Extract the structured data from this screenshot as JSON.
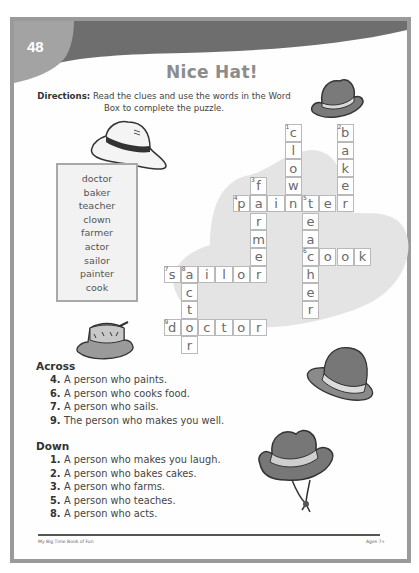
{
  "page": {
    "number": "48",
    "title": "Nice Hat!",
    "directions_label": "Directions:",
    "directions_text": " Read the clues and use the words in the Word Box to complete the puzzle."
  },
  "word_box": {
    "words": [
      "doctor",
      "baker",
      "teacher",
      "clown",
      "farmer",
      "actor",
      "sailor",
      "painter",
      "cook"
    ]
  },
  "puzzle": {
    "cells": [
      {
        "col": 7,
        "row": 0,
        "letter": "c",
        "num": "1"
      },
      {
        "col": 7,
        "row": 1,
        "letter": "l"
      },
      {
        "col": 7,
        "row": 2,
        "letter": "o"
      },
      {
        "col": 7,
        "row": 3,
        "letter": "w"
      },
      {
        "col": 10,
        "row": 0,
        "letter": "b",
        "num": "2"
      },
      {
        "col": 10,
        "row": 1,
        "letter": "a"
      },
      {
        "col": 10,
        "row": 2,
        "letter": "k"
      },
      {
        "col": 10,
        "row": 3,
        "letter": "e"
      },
      {
        "col": 5,
        "row": 3,
        "letter": "f",
        "num": "3"
      },
      {
        "col": 4,
        "row": 4,
        "letter": "p",
        "num": "4"
      },
      {
        "col": 5,
        "row": 4,
        "letter": "a"
      },
      {
        "col": 6,
        "row": 4,
        "letter": "i"
      },
      {
        "col": 7,
        "row": 4,
        "letter": "n"
      },
      {
        "col": 8,
        "row": 4,
        "letter": "t",
        "num": "5"
      },
      {
        "col": 9,
        "row": 4,
        "letter": "e"
      },
      {
        "col": 10,
        "row": 4,
        "letter": "r"
      },
      {
        "col": 5,
        "row": 5,
        "letter": "r"
      },
      {
        "col": 5,
        "row": 6,
        "letter": "m"
      },
      {
        "col": 5,
        "row": 7,
        "letter": "e"
      },
      {
        "col": 8,
        "row": 5,
        "letter": "e"
      },
      {
        "col": 8,
        "row": 6,
        "letter": "a"
      },
      {
        "col": 8,
        "row": 7,
        "letter": "c",
        "num": "6"
      },
      {
        "col": 9,
        "row": 7,
        "letter": "o"
      },
      {
        "col": 10,
        "row": 7,
        "letter": "o"
      },
      {
        "col": 11,
        "row": 7,
        "letter": "k"
      },
      {
        "col": 8,
        "row": 8,
        "letter": "h"
      },
      {
        "col": 8,
        "row": 9,
        "letter": "e"
      },
      {
        "col": 8,
        "row": 10,
        "letter": "r"
      },
      {
        "col": 0,
        "row": 8,
        "letter": "s",
        "num": "7"
      },
      {
        "col": 1,
        "row": 8,
        "letter": "a",
        "num": "8"
      },
      {
        "col": 2,
        "row": 8,
        "letter": "i"
      },
      {
        "col": 3,
        "row": 8,
        "letter": "l"
      },
      {
        "col": 4,
        "row": 8,
        "letter": "o"
      },
      {
        "col": 5,
        "row": 8,
        "letter": "r"
      },
      {
        "col": 1,
        "row": 9,
        "letter": "c"
      },
      {
        "col": 1,
        "row": 10,
        "letter": "t"
      },
      {
        "col": 0,
        "row": 11,
        "letter": "d",
        "num": "9"
      },
      {
        "col": 1,
        "row": 11,
        "letter": "o"
      },
      {
        "col": 2,
        "row": 11,
        "letter": "c"
      },
      {
        "col": 3,
        "row": 11,
        "letter": "t"
      },
      {
        "col": 4,
        "row": 11,
        "letter": "o"
      },
      {
        "col": 5,
        "row": 11,
        "letter": "r"
      },
      {
        "col": 1,
        "row": 12,
        "letter": "r"
      }
    ]
  },
  "clues": {
    "across_heading": "Across",
    "across": [
      {
        "n": "4.",
        "text": "A person who paints."
      },
      {
        "n": "6.",
        "text": "A person who cooks food."
      },
      {
        "n": "7.",
        "text": "A person who sails."
      },
      {
        "n": "9.",
        "text": "The person who makes you well."
      }
    ],
    "down_heading": "Down",
    "down": [
      {
        "n": "1.",
        "text": "A person who makes you laugh."
      },
      {
        "n": "2.",
        "text": "A person who bakes cakes."
      },
      {
        "n": "3.",
        "text": "A person who farms."
      },
      {
        "n": "5.",
        "text": "A person who teaches."
      },
      {
        "n": "8.",
        "text": "A person who acts."
      }
    ]
  },
  "footer": {
    "left": "My Big Time Book of Fun",
    "right": "Ages 7+"
  },
  "colors": {
    "band": "#6e6e6e",
    "tab": "#a3a3a3",
    "blob": "#e4e4e4",
    "hat_dark": "#7a7a7a"
  }
}
